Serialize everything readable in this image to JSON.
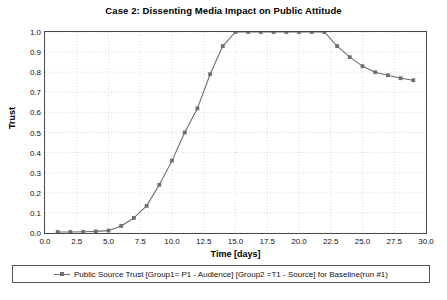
{
  "chart_data": {
    "type": "line",
    "title": "Case 2: Dissenting Media Impact on Public Attitude",
    "xlabel": "Time [days]",
    "ylabel": "Trust",
    "xlim": [
      0.0,
      30.0
    ],
    "ylim": [
      0.0,
      1.0
    ],
    "grid": true,
    "legend_position": "bottom",
    "xticks": [
      "0.0",
      "2.5",
      "5.0",
      "7.5",
      "10.0",
      "12.5",
      "15.0",
      "17.5",
      "20.0",
      "22.5",
      "25.0",
      "27.5",
      "30.0"
    ],
    "yticks": [
      "0.0",
      "0.1",
      "0.2",
      "0.3",
      "0.4",
      "0.5",
      "0.6",
      "0.7",
      "0.8",
      "0.9",
      "1.0"
    ],
    "series": [
      {
        "name": "Public Source Trust [Group1= P1 - Audience] [Group2 =T1 - Source] for Baseline(run #1)",
        "color": "#6f6f6f",
        "marker": "square",
        "x": [
          1,
          2,
          3,
          4,
          5,
          6,
          7,
          8,
          9,
          10,
          11,
          12,
          13,
          14,
          15,
          16,
          17,
          18,
          19,
          20,
          21,
          22,
          23,
          24,
          25,
          26,
          27,
          28,
          29
        ],
        "values": [
          0.005,
          0.005,
          0.006,
          0.008,
          0.012,
          0.035,
          0.075,
          0.135,
          0.24,
          0.36,
          0.5,
          0.62,
          0.79,
          0.93,
          1.0,
          1.0,
          1.0,
          1.0,
          1.0,
          1.0,
          1.0,
          1.0,
          0.93,
          0.875,
          0.83,
          0.8,
          0.785,
          0.77,
          0.76
        ]
      }
    ]
  },
  "legend": {
    "entry_label": "Public Source Trust [Group1= P1 - Audience] [Group2 =T1 - Source] for Baseline(run #1)"
  }
}
